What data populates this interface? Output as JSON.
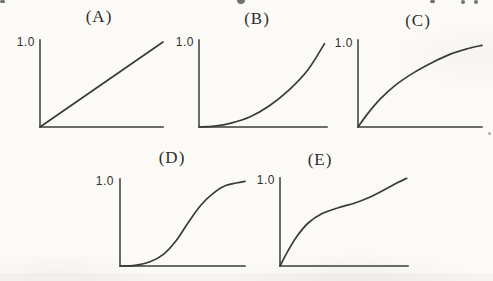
{
  "figure": {
    "kind": "scanned textbook figure with five small line plots",
    "paper_color": "#fbfaf7",
    "ink_color": "#3a3a3a"
  },
  "chart_data": [
    {
      "panel": "A",
      "type": "line",
      "title": "(A)",
      "y_tick_label": "1.0",
      "ylim": [
        0,
        1.0
      ],
      "xlabel": "",
      "ylabel": "",
      "grid": false,
      "shape": "straight line increasing from origin to 1.0 at right end",
      "points": [
        [
          0,
          0
        ],
        [
          1,
          1
        ]
      ]
    },
    {
      "panel": "B",
      "type": "line",
      "title": "(B)",
      "y_tick_label": "1.0",
      "ylim": [
        0,
        1.0
      ],
      "xlabel": "",
      "ylabel": "",
      "grid": false,
      "shape": "convex accelerating curve (concave-up, like x^2), flat at origin then steep to 1.0",
      "points": [
        [
          0,
          0
        ],
        [
          0.12,
          0.01
        ],
        [
          0.25,
          0.045
        ],
        [
          0.4,
          0.12
        ],
        [
          0.55,
          0.25
        ],
        [
          0.7,
          0.43
        ],
        [
          0.85,
          0.67
        ],
        [
          0.98,
          0.98
        ]
      ]
    },
    {
      "panel": "C",
      "type": "line",
      "title": "(C)",
      "y_tick_label": "1.0",
      "ylim": [
        0,
        1.0
      ],
      "xlabel": "",
      "ylabel": "",
      "grid": false,
      "shape": "concave saturating curve, steep at origin then levelling off approaching 1.0",
      "points": [
        [
          0,
          0
        ],
        [
          0.08,
          0.16
        ],
        [
          0.18,
          0.33
        ],
        [
          0.3,
          0.49
        ],
        [
          0.45,
          0.64
        ],
        [
          0.6,
          0.76
        ],
        [
          0.75,
          0.86
        ],
        [
          0.88,
          0.92
        ],
        [
          1,
          0.96
        ]
      ]
    },
    {
      "panel": "D",
      "type": "line",
      "title": "(D)",
      "y_tick_label": "1.0",
      "ylim": [
        0,
        1.0
      ],
      "xlabel": "",
      "ylabel": "",
      "grid": false,
      "shape": "sigmoid S-curve: flat near origin, steep middle, saturating at 1.0",
      "points": [
        [
          0,
          0
        ],
        [
          0.12,
          0.008
        ],
        [
          0.24,
          0.05
        ],
        [
          0.35,
          0.14
        ],
        [
          0.45,
          0.3
        ],
        [
          0.55,
          0.52
        ],
        [
          0.65,
          0.72
        ],
        [
          0.75,
          0.86
        ],
        [
          0.85,
          0.95
        ],
        [
          1,
          0.995
        ]
      ]
    },
    {
      "panel": "E",
      "type": "line",
      "title": "(E)",
      "y_tick_label": "1.0",
      "ylim": [
        0,
        1.0
      ],
      "xlabel": "",
      "ylabel": "",
      "grid": false,
      "shape": "steep initial rise, mid-range plateau, then second steep rise reaching 1.0",
      "points": [
        [
          0,
          0
        ],
        [
          0.06,
          0.17
        ],
        [
          0.13,
          0.34
        ],
        [
          0.22,
          0.5
        ],
        [
          0.33,
          0.61
        ],
        [
          0.46,
          0.68
        ],
        [
          0.58,
          0.73
        ],
        [
          0.7,
          0.8
        ],
        [
          0.82,
          0.89
        ],
        [
          0.92,
          0.97
        ],
        [
          0.99,
          1.02
        ]
      ]
    }
  ]
}
